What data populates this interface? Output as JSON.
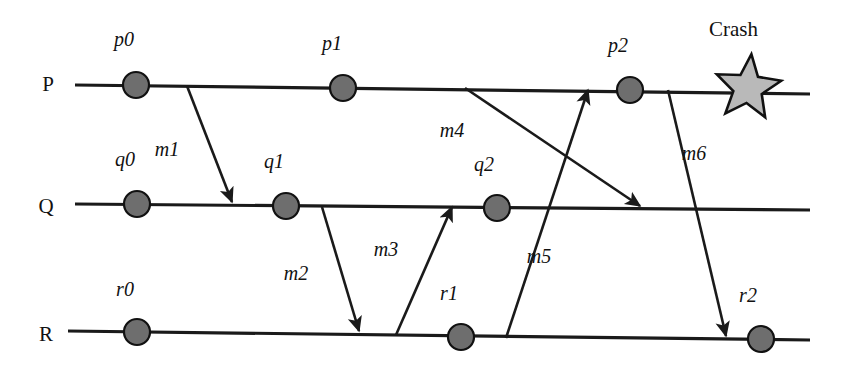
{
  "figure": {
    "kind": "space-time-diagram",
    "background_color": "#ffffff",
    "ink_color": "#1a1a1a",
    "dot_fill_color": "#6e6e6e",
    "star_fill_color": "#b9b9b9"
  },
  "processes": [
    {
      "id": "P",
      "label": "P",
      "label_x": 48,
      "label_y": 91,
      "line_x1": 75,
      "line_y1": 85,
      "line_x2": 810,
      "line_y2": 94
    },
    {
      "id": "Q",
      "label": "Q",
      "label_x": 46,
      "label_y": 213,
      "line_x1": 75,
      "line_y1": 204,
      "line_x2": 810,
      "line_y2": 210
    },
    {
      "id": "R",
      "label": "R",
      "label_x": 46,
      "label_y": 341,
      "line_x1": 68,
      "line_y1": 331,
      "line_x2": 810,
      "line_y2": 340
    }
  ],
  "events": [
    {
      "id": "p0",
      "label": "p0",
      "process": "P",
      "cx": 136,
      "cy": 85,
      "r": 13,
      "label_x": 124,
      "label_y": 46
    },
    {
      "id": "p1",
      "label": "p1",
      "process": "P",
      "cx": 343,
      "cy": 88,
      "r": 13,
      "label_x": 332,
      "label_y": 50
    },
    {
      "id": "p2",
      "label": "p2",
      "process": "P",
      "cx": 630,
      "cy": 90,
      "r": 13,
      "label_x": 618,
      "label_y": 52
    },
    {
      "id": "q0",
      "label": "q0",
      "process": "Q",
      "cx": 137,
      "cy": 204,
      "r": 13,
      "label_x": 125,
      "label_y": 166
    },
    {
      "id": "q1",
      "label": "q1",
      "process": "Q",
      "cx": 286,
      "cy": 206,
      "r": 13,
      "label_x": 274,
      "label_y": 168
    },
    {
      "id": "q2",
      "label": "q2",
      "process": "Q",
      "cx": 497,
      "cy": 208,
      "r": 13,
      "label_x": 484,
      "label_y": 171
    },
    {
      "id": "r0",
      "label": "r0",
      "process": "R",
      "cx": 137,
      "cy": 332,
      "r": 13,
      "label_x": 125,
      "label_y": 296
    },
    {
      "id": "r1",
      "label": "r1",
      "process": "R",
      "cx": 461,
      "cy": 337,
      "r": 13,
      "label_x": 449,
      "label_y": 300
    },
    {
      "id": "r2",
      "label": "r2",
      "process": "R",
      "cx": 761,
      "cy": 339,
      "r": 13,
      "label_x": 748,
      "label_y": 302
    }
  ],
  "messages": [
    {
      "id": "m1",
      "label": "m1",
      "from": "P",
      "to": "Q",
      "x1": 187,
      "y1": 86,
      "x2": 232,
      "y2": 202,
      "label_x": 167,
      "label_y": 156
    },
    {
      "id": "m2",
      "label": "m2",
      "from": "Q",
      "to": "R",
      "x1": 322,
      "y1": 207,
      "x2": 359,
      "y2": 331,
      "label_x": 296,
      "label_y": 280
    },
    {
      "id": "m3",
      "label": "m3",
      "from": "R",
      "to": "Q",
      "x1": 396,
      "y1": 335,
      "x2": 452,
      "y2": 207,
      "label_x": 386,
      "label_y": 256
    },
    {
      "id": "m4",
      "label": "m4",
      "from": "P",
      "to": "Q",
      "x1": 465,
      "y1": 88,
      "x2": 640,
      "y2": 206,
      "label_x": 452,
      "label_y": 137
    },
    {
      "id": "m5",
      "label": "m5",
      "from": "R",
      "to": "P",
      "x1": 506,
      "y1": 338,
      "x2": 588,
      "y2": 90,
      "label_x": 539,
      "label_y": 263
    },
    {
      "id": "m6",
      "label": "m6",
      "from": "P",
      "to": "R",
      "x1": 668,
      "y1": 90,
      "x2": 726,
      "y2": 336,
      "label_x": 694,
      "label_y": 160
    }
  ],
  "crash": {
    "label": "Crash",
    "label_x": 709,
    "label_y": 36,
    "star_cx": 748,
    "star_cy": 88,
    "star_outer_r": 34,
    "star_inner_r": 15
  }
}
